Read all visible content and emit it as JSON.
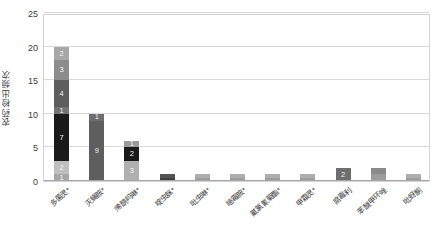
{
  "chart_data": {
    "type": "bar",
    "subtype": "stacked-bar",
    "title": "",
    "xlabel": "",
    "ylabel": "农药检出频次",
    "ylim": [
      0,
      25
    ],
    "yticks": [
      0,
      5,
      10,
      15,
      20,
      25
    ],
    "grid": true,
    "legend": "none",
    "categories": [
      "多菌灵*",
      "灭蝇胺*",
      "烯酰吗啉*",
      "啶虫脒*",
      "吡虫啉*",
      "嘧霉胺*",
      "氟氯氰菊酯*",
      "甲霜灵*",
      "腐霉利",
      "苯醚甲环唑",
      "吡蚜酮"
    ],
    "values": [
      20,
      10,
      6,
      1,
      1,
      1,
      1,
      1,
      2,
      2,
      1
    ],
    "stacks": [
      {
        "category": "多菌灵*",
        "total": 20,
        "segments": [
          {
            "label": "1",
            "value": 1,
            "color": "#a6a6a6"
          },
          {
            "label": "2",
            "value": 2,
            "color": "#bfbfbf"
          },
          {
            "label": "7",
            "value": 7,
            "color": "#1a1a1a"
          },
          {
            "label": "1",
            "value": 1,
            "color": "#737373"
          },
          {
            "label": "4",
            "value": 4,
            "color": "#5e5e5e"
          },
          {
            "label": "3",
            "value": 3,
            "color": "#8c8c8c"
          },
          {
            "label": "2",
            "value": 2,
            "color": "#a8a8a8"
          }
        ]
      },
      {
        "category": "灭蝇胺*",
        "total": 10,
        "segments": [
          {
            "label": "9",
            "value": 9,
            "color": "#5e5e5e"
          },
          {
            "label": "1",
            "value": 1,
            "color": "#6e6e6e"
          }
        ]
      },
      {
        "category": "烯酰吗啉*",
        "total": 6,
        "segments": [
          {
            "label": "3",
            "value": 3,
            "color": "#b0b0b0"
          },
          {
            "label": "2",
            "value": 2,
            "color": "#1a1a1a"
          },
          {
            "label": "1",
            "value": 1,
            "color": "#9a9a9a"
          }
        ]
      },
      {
        "category": "啶虫脒*",
        "total": 1,
        "segments": [
          {
            "label": "",
            "value": 0.5,
            "color": "#404040"
          },
          {
            "label": "",
            "value": 0.5,
            "color": "#555555"
          }
        ]
      },
      {
        "category": "吡虫啉*",
        "total": 1,
        "segments": [
          {
            "label": "",
            "value": 0.5,
            "color": "#9c9c9c"
          },
          {
            "label": "",
            "value": 0.5,
            "color": "#aeaeae"
          }
        ]
      },
      {
        "category": "嘧霉胺*",
        "total": 1,
        "segments": [
          {
            "label": "",
            "value": 0.5,
            "color": "#9c9c9c"
          },
          {
            "label": "",
            "value": 0.5,
            "color": "#aeaeae"
          }
        ]
      },
      {
        "category": "氟氯氰菊酯*",
        "total": 1,
        "segments": [
          {
            "label": "",
            "value": 0.5,
            "color": "#9c9c9c"
          },
          {
            "label": "",
            "value": 0.5,
            "color": "#aeaeae"
          }
        ]
      },
      {
        "category": "甲霜灵*",
        "total": 1,
        "segments": [
          {
            "label": "",
            "value": 0.5,
            "color": "#9c9c9c"
          },
          {
            "label": "",
            "value": 0.5,
            "color": "#aeaeae"
          }
        ]
      },
      {
        "category": "腐霉利",
        "total": 2,
        "segments": [
          {
            "label": "2",
            "value": 2,
            "color": "#6e6e6e"
          }
        ]
      },
      {
        "category": "苯醚甲环唑",
        "total": 2,
        "segments": [
          {
            "label": "",
            "value": 1,
            "color": "#9c9c9c"
          },
          {
            "label": "",
            "value": 1,
            "color": "#8a8a8a"
          }
        ]
      },
      {
        "category": "吡蚜酮",
        "total": 1,
        "segments": [
          {
            "label": "",
            "value": 0.5,
            "color": "#9c9c9c"
          },
          {
            "label": "",
            "value": 0.5,
            "color": "#aeaeae"
          }
        ]
      }
    ]
  }
}
